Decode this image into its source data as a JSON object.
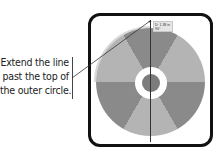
{
  "callout": {
    "lines": [
      "Extend the line",
      "past the top of",
      "the outer circle."
    ]
  },
  "artwork": {
    "colors": {
      "dark_sector": "#8a8a8a",
      "light_sector": "#b4b4b4",
      "hub": "#7c7c7c",
      "ring": "#ffffff",
      "frame": "#111111"
    },
    "sectors": [
      {
        "start_deg": -30,
        "end_deg": 30,
        "tone": "dark"
      },
      {
        "start_deg": 30,
        "end_deg": 90,
        "tone": "light"
      },
      {
        "start_deg": 90,
        "end_deg": 150,
        "tone": "dark"
      },
      {
        "start_deg": 150,
        "end_deg": 210,
        "tone": "light"
      },
      {
        "start_deg": 210,
        "end_deg": 270,
        "tone": "dark"
      },
      {
        "start_deg": 270,
        "end_deg": 330,
        "tone": "light"
      }
    ]
  },
  "tooltip": {
    "distance": "D: 1.38 in",
    "angle": "90°"
  },
  "icons": {
    "cursor": "crosshair-cursor-icon"
  }
}
